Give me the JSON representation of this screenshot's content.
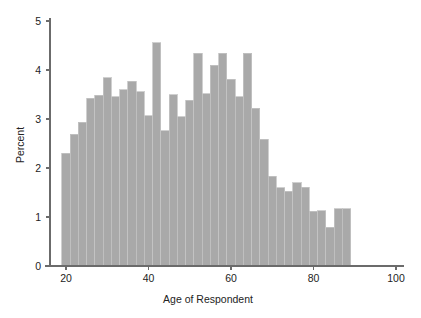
{
  "chart_data": {
    "type": "bar",
    "title": "",
    "subtitle": "",
    "xlabel": "Age of Respondent",
    "ylabel": "Percent",
    "xlim": [
      15,
      102
    ],
    "ylim": [
      0,
      5
    ],
    "xticks": [
      20,
      40,
      60,
      80,
      100
    ],
    "xtick_labels": [
      "20",
      "40",
      "60",
      "80",
      "100"
    ],
    "yticks": [
      0,
      1,
      2,
      3,
      4,
      5
    ],
    "ytick_labels": [
      "0",
      "1",
      "2",
      "3",
      "4",
      "5"
    ],
    "grid": false,
    "legend": null,
    "bin_width": 2,
    "bar_color": "#a9a9a9",
    "bar_edge_color": "#c4c4c4",
    "axis_color": "#6b6b6b",
    "background_color": "#ffffff",
    "categories": [
      "19",
      "21",
      "23",
      "25",
      "27",
      "29",
      "31",
      "33",
      "35",
      "37",
      "39",
      "41",
      "43",
      "45",
      "47",
      "49",
      "51",
      "53",
      "55",
      "57",
      "59",
      "61",
      "63",
      "65",
      "67",
      "69",
      "71",
      "73",
      "75",
      "77",
      "79",
      "81",
      "83",
      "85",
      "87"
    ],
    "bin_starts": [
      19,
      21,
      23,
      25,
      27,
      29,
      31,
      33,
      35,
      37,
      39,
      41,
      43,
      45,
      47,
      49,
      51,
      53,
      55,
      57,
      59,
      61,
      63,
      65,
      67,
      69,
      71,
      73,
      75,
      77,
      79,
      81,
      83,
      85,
      87
    ],
    "values": [
      2.3,
      2.69,
      2.93,
      3.42,
      3.48,
      3.84,
      3.45,
      3.6,
      3.77,
      3.56,
      3.07,
      4.56,
      2.76,
      3.49,
      3.05,
      3.38,
      4.34,
      3.52,
      4.1,
      4.34,
      3.81,
      3.45,
      4.34,
      3.22,
      2.59,
      1.83,
      1.6,
      1.53,
      1.7,
      1.61,
      1.12,
      1.13,
      0.79,
      1.17,
      1.17
    ],
    "units": "percent"
  },
  "axis": {
    "x_title": "Age of Respondent",
    "y_title": "Percent"
  }
}
